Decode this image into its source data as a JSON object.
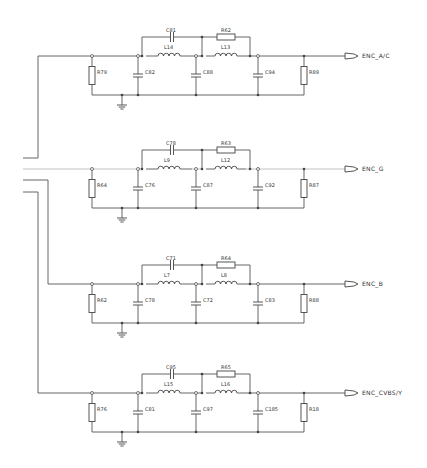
{
  "diagram": {
    "type": "circuit-schematic",
    "input_wires": [
      {
        "id": "in1",
        "y": 158,
        "to_block": 0
      },
      {
        "id": "in2",
        "y": 169,
        "to_block": 1,
        "style": "light"
      },
      {
        "id": "in3",
        "y": 180,
        "to_block": 2
      },
      {
        "id": "in4",
        "y": 192,
        "to_block": 3
      }
    ],
    "blocks": [
      {
        "y": 56,
        "net_label": "ENC_A/C",
        "r_in": "R79",
        "c_in": "C82",
        "l1": "L14",
        "c_mid": "C88",
        "l2": "L13",
        "c_out": "C94",
        "r_out": "R89",
        "c_bypass": "C81",
        "r_bypass": "R62"
      },
      {
        "y": 169,
        "net_label": "ENC_G",
        "r_in": "R64",
        "c_in": "C76",
        "l1": "L9",
        "c_mid": "C87",
        "l2": "L12",
        "c_out": "C92",
        "r_out": "R87",
        "c_bypass": "C78",
        "r_bypass": "R63"
      },
      {
        "y": 284,
        "net_label": "ENC_B",
        "r_in": "R62",
        "c_in": "C78",
        "l1": "L7",
        "c_mid": "C72",
        "l2": "L8",
        "c_out": "C83",
        "r_out": "R88",
        "c_bypass": "C71",
        "r_bypass": "R64"
      },
      {
        "y": 393,
        "net_label": "ENC_CVBS/Y",
        "r_in": "R76",
        "c_in": "C81",
        "l1": "L15",
        "c_mid": "C97",
        "l2": "L16",
        "c_out": "C185",
        "r_out": "R18",
        "c_bypass": "C95",
        "r_bypass": "R65"
      }
    ]
  }
}
